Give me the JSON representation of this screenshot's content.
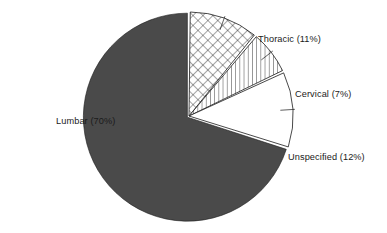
{
  "chart_data": {
    "type": "pie",
    "title": "",
    "subtitle": "",
    "xlabel": "",
    "ylabel": "",
    "legend_position": "none",
    "grid": false,
    "categories": [
      "Lumbar",
      "Thoracic",
      "Cervical",
      "Unspecified"
    ],
    "values": [
      70,
      11,
      7,
      12
    ],
    "unit": "%",
    "slices": [
      {
        "name": "Lumbar",
        "value": 70,
        "label": "Lumbar (70%)",
        "fill_style": "solid",
        "color": "#4a4a4a",
        "label_x": 56,
        "label_y": 124,
        "label_anchor": "start"
      },
      {
        "name": "Thoracic",
        "value": 11,
        "label": "Thoracic (11%)",
        "fill_style": "crosshatch",
        "color": "#ffffff",
        "label_x": 258,
        "label_y": 42,
        "label_anchor": "start"
      },
      {
        "name": "Cervical",
        "value": 7,
        "label": "Cervical (7%)",
        "fill_style": "vertical-hatch",
        "color": "#ffffff",
        "label_x": 295,
        "label_y": 97,
        "label_anchor": "start"
      },
      {
        "name": "Unspecified",
        "value": 12,
        "label": "Unspecified (12%)",
        "fill_style": "none",
        "color": "#ffffff",
        "label_x": 288,
        "label_y": 160,
        "label_anchor": "start"
      }
    ],
    "geometry": {
      "center_x": 189,
      "center_y": 116,
      "radius": 104,
      "start_angle_deg": -90,
      "direction": "clockwise"
    },
    "colors": {
      "background": "#ffffff",
      "lumbar_fill": "#4a4a4a",
      "outline": "#1a1a1a",
      "hatch": "#1a1a1a",
      "text": "#1a1a1a"
    }
  }
}
